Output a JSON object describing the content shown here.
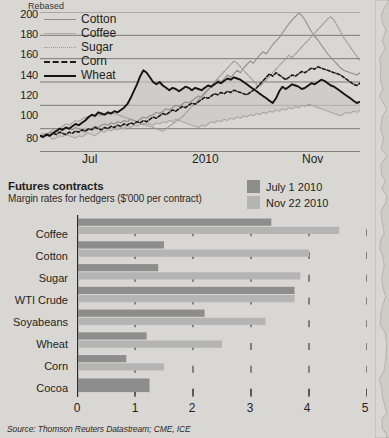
{
  "line_chart_axis_title": "Rebased",
  "source": "Source: Thomson Reuters Datastream; CME, ICE",
  "section": {
    "title": "Futures contracts",
    "subtitle": "Margin rates for hedgers ($'000 per contract)"
  },
  "bar_legend": [
    {
      "label": "July 1 2010",
      "color": "#8d8d8d"
    },
    {
      "label": "Nov 22 2010",
      "color": "#b4b4b4"
    }
  ],
  "chart_data": [
    {
      "type": "line",
      "title": "Rebased",
      "ylabel": "Rebased",
      "xlabel": "",
      "ylim": [
        80,
        200
      ],
      "yticks": [
        200,
        180,
        160,
        140,
        120,
        100,
        80
      ],
      "xticks": [
        "Jul",
        "2010",
        "Nov"
      ],
      "grid": true,
      "legend_position": "top-left",
      "legend": [
        "Cotton",
        "Coffee",
        "Sugar",
        "Corn",
        "Wheat"
      ],
      "series": [
        {
          "name": "Cotton",
          "style": "solid",
          "color": "#8e8e8e",
          "values": [
            94,
            93,
            95,
            97,
            96,
            98,
            97,
            99,
            101,
            100,
            99,
            101,
            100,
            98,
            97,
            99,
            100,
            102,
            101,
            103,
            104,
            103,
            105,
            104,
            106,
            105,
            107,
            106,
            108,
            107,
            106,
            108,
            110,
            109,
            111,
            112,
            114,
            113,
            115,
            117,
            116,
            118,
            120,
            119,
            121,
            123,
            122,
            124,
            126,
            128,
            127,
            130,
            133,
            136,
            139,
            142,
            140,
            143,
            146,
            144,
            147,
            150,
            148,
            152,
            155,
            158,
            156,
            160,
            163,
            166,
            164,
            168,
            172,
            175,
            178,
            182,
            186,
            190,
            193,
            196,
            199,
            197,
            193,
            188,
            183,
            179,
            176,
            172,
            168,
            164,
            161,
            158,
            155,
            152,
            150,
            149,
            148,
            147,
            146,
            148
          ]
        },
        {
          "name": "Coffee",
          "style": "solid",
          "color": "#a8a8a8",
          "values": [
            93,
            92,
            94,
            93,
            91,
            92,
            94,
            93,
            95,
            94,
            93,
            92,
            94,
            93,
            95,
            96,
            95,
            94,
            96,
            98,
            97,
            99,
            98,
            100,
            99,
            101,
            100,
            102,
            101,
            103,
            102,
            104,
            103,
            105,
            104,
            103,
            105,
            104,
            106,
            105,
            107,
            106,
            108,
            107,
            106,
            105,
            104,
            103,
            102,
            101,
            103,
            102,
            104,
            106,
            105,
            107,
            106,
            108,
            107,
            109,
            108,
            110,
            109,
            111,
            110,
            112,
            111,
            113,
            112,
            114,
            113,
            115,
            114,
            116,
            115,
            117,
            116,
            118,
            117,
            119,
            118,
            120,
            119,
            121,
            120,
            119,
            118,
            117,
            116,
            115,
            114,
            113,
            112,
            111,
            113,
            114,
            113,
            115,
            114,
            116
          ]
        },
        {
          "name": "Sugar",
          "style": "dotted",
          "color": "#9b9b9b",
          "values": [
            94,
            96,
            95,
            97,
            99,
            98,
            100,
            102,
            104,
            103,
            105,
            107,
            106,
            108,
            110,
            109,
            111,
            110,
            112,
            111,
            113,
            112,
            114,
            113,
            112,
            111,
            110,
            109,
            108,
            107,
            106,
            105,
            104,
            103,
            102,
            101,
            100,
            99,
            98,
            100,
            102,
            104,
            106,
            108,
            110,
            113,
            116,
            119,
            122,
            125,
            128,
            131,
            134,
            137,
            140,
            143,
            146,
            149,
            152,
            155,
            158,
            156,
            153,
            150,
            147,
            144,
            141,
            138,
            136,
            139,
            142,
            145,
            148,
            151,
            154,
            157,
            160,
            163,
            161,
            164,
            167,
            170,
            173,
            176,
            179,
            182,
            185,
            188,
            191,
            194,
            196,
            193,
            188,
            183,
            178,
            174,
            170,
            166,
            162,
            158
          ]
        },
        {
          "name": "Corn",
          "style": "dashed",
          "color": "#1b1b1b",
          "values": [
            94,
            93,
            95,
            94,
            96,
            95,
            97,
            96,
            95,
            97,
            96,
            98,
            97,
            99,
            98,
            100,
            99,
            101,
            100,
            99,
            101,
            100,
            102,
            101,
            103,
            102,
            104,
            103,
            105,
            104,
            106,
            105,
            107,
            106,
            108,
            110,
            109,
            111,
            113,
            112,
            114,
            116,
            115,
            117,
            119,
            118,
            120,
            122,
            121,
            123,
            125,
            127,
            126,
            128,
            130,
            129,
            131,
            130,
            132,
            131,
            133,
            132,
            131,
            130,
            129,
            131,
            133,
            135,
            138,
            141,
            144,
            147,
            145,
            148,
            146,
            144,
            142,
            144,
            146,
            145,
            147,
            149,
            148,
            150,
            152,
            151,
            153,
            152,
            151,
            150,
            149,
            148,
            147,
            146,
            144,
            142,
            140,
            138,
            137,
            139
          ]
        },
        {
          "name": "Wheat",
          "style": "solid-thick",
          "color": "#141414",
          "values": [
            94,
            93,
            95,
            94,
            96,
            98,
            100,
            99,
            101,
            100,
            102,
            104,
            103,
            105,
            107,
            110,
            112,
            111,
            114,
            113,
            112,
            114,
            113,
            115,
            114,
            116,
            118,
            121,
            126,
            132,
            138,
            145,
            150,
            148,
            144,
            140,
            138,
            140,
            137,
            135,
            133,
            135,
            134,
            132,
            134,
            136,
            135,
            133,
            135,
            134,
            133,
            135,
            137,
            136,
            138,
            140,
            139,
            141,
            143,
            142,
            144,
            143,
            142,
            140,
            138,
            136,
            134,
            132,
            130,
            128,
            126,
            124,
            122,
            126,
            132,
            136,
            134,
            136,
            138,
            137,
            136,
            134,
            135,
            137,
            139,
            138,
            140,
            142,
            141,
            139,
            137,
            136,
            134,
            132,
            130,
            128,
            126,
            124,
            122,
            123
          ]
        }
      ]
    },
    {
      "type": "bar",
      "orientation": "horizontal",
      "title": "Futures contracts",
      "subtitle": "Margin rates for hedgers ($'000 per contract)",
      "xlabel": "",
      "ylabel": "",
      "xlim": [
        0,
        5
      ],
      "xticks": [
        0,
        1,
        2,
        3,
        4,
        5
      ],
      "grid": false,
      "categories": [
        "Coffee",
        "Cotton",
        "Sugar",
        "WTI Crude",
        "Soyabeans",
        "Wheat",
        "Corn",
        "Cocoa"
      ],
      "series": [
        {
          "name": "July 1 2010",
          "color": "#8d8d8d",
          "values": [
            3.35,
            1.5,
            1.4,
            3.75,
            2.2,
            1.2,
            0.85,
            1.25
          ]
        },
        {
          "name": "Nov 22 2010",
          "color": "#b4b4b4",
          "values": [
            4.52,
            4.0,
            3.85,
            3.75,
            3.25,
            2.5,
            1.5,
            null
          ]
        }
      ]
    }
  ]
}
